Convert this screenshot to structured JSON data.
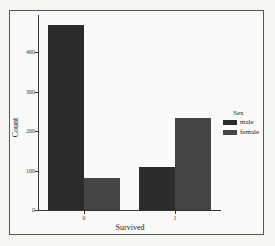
{
  "chart_data": {
    "type": "bar",
    "title": "",
    "xlabel": "Survived",
    "ylabel": "Count",
    "categories": [
      "0",
      "1"
    ],
    "series": [
      {
        "name": "male",
        "values": [
          468,
          109
        ],
        "color": "#2b2b2b"
      },
      {
        "name": "female",
        "values": [
          81,
          233
        ],
        "color": "#454545"
      }
    ],
    "yticks": [
      0,
      100,
      200,
      300,
      400
    ],
    "ylim": [
      0,
      495
    ],
    "grid": false,
    "legend": {
      "title": "Sex",
      "position": "right",
      "entries": [
        "male",
        "female"
      ]
    }
  },
  "labels": {
    "xlabel": "Survived",
    "ylabel": "Count",
    "legend_title": "Sex",
    "legend_male": "male",
    "legend_female": "female",
    "ytick_0": "0",
    "ytick_100": "100",
    "ytick_200": "200",
    "ytick_300": "300",
    "ytick_400": "400",
    "xtick_0": "0",
    "xtick_1": "1"
  }
}
